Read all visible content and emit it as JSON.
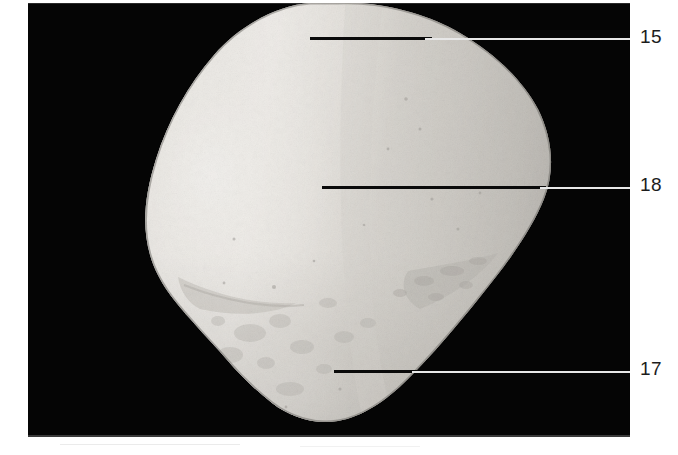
{
  "figure": {
    "type": "anatomical-photograph",
    "background_color": "#050505",
    "page_color": "#ffffff",
    "plate": {
      "x": 28,
      "y": 3,
      "width": 602,
      "height": 434
    }
  },
  "callouts": [
    {
      "id": "callout-15",
      "label": "15",
      "label_x": 640,
      "label_y": 27,
      "line": {
        "y": 37,
        "dark_start": 310,
        "dark_end": 432,
        "light_start": 425,
        "light_end": 630
      }
    },
    {
      "id": "callout-18",
      "label": "18",
      "label_x": 640,
      "label_y": 175,
      "line": {
        "y": 186,
        "dark_start": 322,
        "dark_end": 546,
        "light_start": 540,
        "light_end": 630
      }
    },
    {
      "id": "callout-17",
      "label": "17",
      "label_x": 640,
      "label_y": 359,
      "line": {
        "y": 370,
        "dark_start": 334,
        "dark_end": 418,
        "light_start": 412,
        "light_end": 630
      }
    }
  ],
  "specimen": {
    "outline_fill": "#d7d4cf",
    "highlight_fill": "#f2f0ec",
    "shadow_fill": "#b8b5b0",
    "description": "rounded irregular bone, broad superior pole tapering to a rounded inferior apex"
  }
}
